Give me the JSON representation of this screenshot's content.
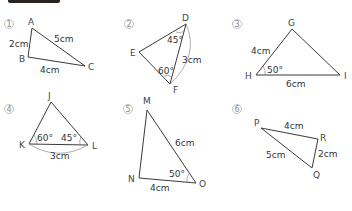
{
  "header": {
    "bar_color": "#2b2320"
  },
  "problems": [
    {
      "number": "1",
      "vertices": {
        "A": "A",
        "B": "B",
        "C": "C"
      },
      "labels": {
        "AB": "2cm",
        "AC": "5cm",
        "BC": "4cm"
      }
    },
    {
      "number": "2",
      "vertices": {
        "D": "D",
        "E": "E",
        "F": "F"
      },
      "labels": {
        "angle_D": "45°",
        "angle_F": "60°",
        "DF": "3cm"
      }
    },
    {
      "number": "3",
      "vertices": {
        "G": "G",
        "H": "H",
        "I": "I"
      },
      "labels": {
        "GH": "4cm",
        "angle_H": "50°",
        "HI": "6cm"
      }
    },
    {
      "number": "4",
      "vertices": {
        "J": "J",
        "K": "K",
        "L": "L"
      },
      "labels": {
        "angle_K": "60°",
        "angle_L": "45°",
        "KL": "3cm"
      }
    },
    {
      "number": "5",
      "vertices": {
        "M": "M",
        "N": "N",
        "O": "O"
      },
      "labels": {
        "MO": "6cm",
        "angle_O": "50°",
        "NO": "4cm"
      }
    },
    {
      "number": "6",
      "vertices": {
        "P": "P",
        "Q": "Q",
        "R": "R"
      },
      "labels": {
        "PR": "4cm",
        "PQ": "5cm",
        "QR": "2cm"
      }
    }
  ]
}
